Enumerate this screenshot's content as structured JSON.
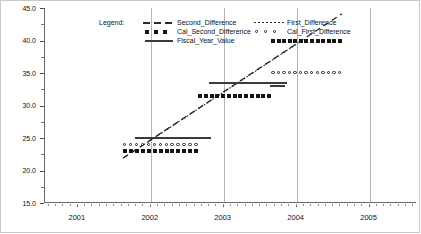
{
  "chart_data": {
    "type": "line",
    "title": "",
    "xlabel": "",
    "ylabel": "",
    "xlim": [
      2000.55,
      2005.65
    ],
    "ylim": [
      15.0,
      45.0
    ],
    "grid": "vertical-major",
    "y_ticks": [
      "45.0",
      "40.0",
      "35.0",
      "30.0",
      "25.0",
      "20.0",
      "15.0"
    ],
    "y_tick_values": [
      45.0,
      40.0,
      35.0,
      30.0,
      25.0,
      20.0,
      15.0
    ],
    "x_ticks": [
      "2001",
      "2002",
      "2003",
      "2004",
      "2005"
    ],
    "x_tick_values": [
      2001,
      2002,
      2003,
      2004,
      2005
    ],
    "legend": {
      "title": "Legend:",
      "position": "top-left-inside",
      "entries": [
        {
          "label": "Second_Difference",
          "marker": "dashed-line",
          "column": 1
        },
        {
          "label": "Cal_Second_Difference",
          "marker": "filled-squares",
          "column": 1
        },
        {
          "label": "Fiscal_Year_Value",
          "marker": "solid-line",
          "column": 1
        },
        {
          "label": "First_Difference",
          "marker": "dotted-line",
          "column": 2
        },
        {
          "label": "Cal_First_Difference",
          "marker": "open-circles",
          "column": 2
        }
      ]
    },
    "series": [
      {
        "name": "Second_Difference",
        "style": "dashed-line",
        "points": [
          [
            2001.62,
            21.9
          ],
          [
            2004.62,
            44.1
          ]
        ]
      },
      {
        "name": "First_Difference",
        "style": "dotted-line",
        "points": [
          [
            2001.95,
            24.3
          ],
          [
            2004.02,
            39.6
          ]
        ]
      },
      {
        "name": "Fiscal_Year_Value",
        "style": "solid-line-segments",
        "segments": [
          {
            "x_start": 2001.78,
            "x_end": 2002.82,
            "value": 25.0
          },
          {
            "x_start": 2002.8,
            "x_end": 2003.87,
            "value": 33.5
          },
          {
            "x_start": 2003.63,
            "x_end": 2003.84,
            "value": 33.0
          }
        ]
      },
      {
        "name": "Cal_Second_Difference",
        "style": "filled-squares",
        "segments": [
          {
            "x_start": 2001.62,
            "x_end": 2002.65,
            "value": 23.0,
            "count": 13
          },
          {
            "x_start": 2002.65,
            "x_end": 2003.65,
            "value": 31.5,
            "count": 13
          },
          {
            "x_start": 2003.65,
            "x_end": 2004.62,
            "value": 40.0,
            "count": 13
          }
        ]
      },
      {
        "name": "Cal_First_Difference",
        "style": "open-circles",
        "segments": [
          {
            "x_start": 2001.62,
            "x_end": 2002.65,
            "value": 24.0,
            "count": 13
          },
          {
            "x_start": 2003.65,
            "x_end": 2004.62,
            "value": 35.0,
            "count": 13
          }
        ]
      }
    ]
  }
}
